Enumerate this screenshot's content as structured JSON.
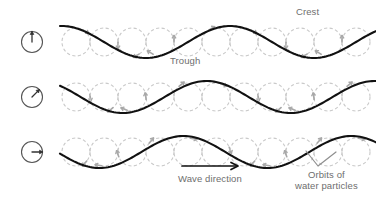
{
  "figure": {
    "type": "wave-motion-diagram",
    "background_color": "#ffffff",
    "wave_color": "#111111",
    "orbit_color": "#c9c9c9",
    "text_color": "#6e6e6e",
    "width": 376,
    "height": 202
  },
  "labels": {
    "crest": "Crest",
    "trough": "Trough",
    "wave_direction": "Wave direction",
    "orbits_line1": "Orbits of",
    "orbits_line2": "water particles"
  },
  "phase_indicators": [
    {
      "name": "phase-indicator-up",
      "angle_deg": 0,
      "description": "arrow pointing up"
    },
    {
      "name": "phase-indicator-diagonal",
      "angle_deg": 45,
      "description": "arrow pointing up-right"
    },
    {
      "name": "phase-indicator-right",
      "angle_deg": 90,
      "description": "arrow pointing right"
    }
  ],
  "chart_data": {
    "type": "line",
    "title": "",
    "xlabel": "Wave direction",
    "ylabel": "",
    "grid": false,
    "legend": "none",
    "xlim": [
      60,
      376
    ],
    "wave": {
      "amplitude": 16,
      "wavelength": 168,
      "circle_diameter": 28,
      "circle_count": 11,
      "circle_start_x": 62
    },
    "series": [
      {
        "name": "row-1",
        "baseline_y": 42,
        "phase_deg": 0,
        "indicator_angle_deg": 0
      },
      {
        "name": "row-2",
        "baseline_y": 97,
        "phase_deg": 50,
        "indicator_angle_deg": 45
      },
      {
        "name": "row-3",
        "baseline_y": 152,
        "phase_deg": 100,
        "indicator_angle_deg": 90
      }
    ],
    "annotations": [
      {
        "text": "Crest",
        "x": 320,
        "y": 14,
        "points_to": "wave peak of row 1"
      },
      {
        "text": "Trough",
        "x": 196,
        "y": 62,
        "points_to": "wave low of row 1"
      },
      {
        "text": "Wave direction",
        "x": 218,
        "y": 178,
        "arrow": "right"
      },
      {
        "text": "Orbits of water particles",
        "x": 330,
        "y": 180,
        "points_to": "orbit circles"
      }
    ]
  }
}
